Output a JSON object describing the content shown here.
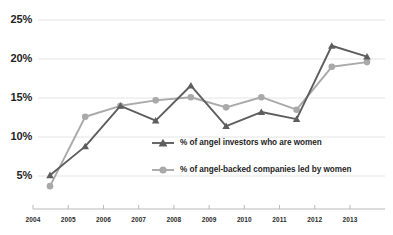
{
  "chart_data": {
    "type": "line",
    "title": "",
    "xlabel": "",
    "ylabel": "",
    "x": [
      "2004",
      "2005",
      "2006",
      "2007",
      "2008",
      "2009",
      "2010",
      "2011",
      "2012",
      "2013"
    ],
    "categories": [
      "2004",
      "2005",
      "2006",
      "2007",
      "2008",
      "2009",
      "2010",
      "2011",
      "2012",
      "2013"
    ],
    "ylim": [
      0,
      25
    ],
    "yticks": [
      5,
      10,
      15,
      20,
      25
    ],
    "ytick_labels": [
      "5%",
      "10%",
      "15%",
      "20%",
      "25%"
    ],
    "grid": true,
    "grid_axis": "y",
    "legend_position": "inside-center-right",
    "series": [
      {
        "name": "% of angel investors who are women",
        "color": "#5e5e5e",
        "marker": "triangle",
        "values": [
          5.1,
          8.8,
          14.0,
          12.1,
          16.6,
          11.4,
          13.2,
          12.3,
          21.7,
          20.3
        ]
      },
      {
        "name": "% of angel-backed companies led by women",
        "color": "#a9a9a9",
        "marker": "circle",
        "values": [
          3.7,
          12.6,
          14.0,
          14.7,
          15.1,
          13.8,
          15.1,
          13.5,
          19.0,
          19.6
        ]
      }
    ]
  },
  "axes": {
    "y_labels": [
      "25%",
      "20%",
      "15%",
      "10%",
      "5%"
    ],
    "x_labels": [
      "2004",
      "2005",
      "2006",
      "2007",
      "2008",
      "2009",
      "2010",
      "2011",
      "2012",
      "2013"
    ]
  },
  "legend": {
    "entries": [
      {
        "label": "% of angel investors who are women",
        "marker": "triangle-marker-icon",
        "color": "#5e5e5e"
      },
      {
        "label": "% of angel-backed companies led by women",
        "marker": "circle-marker-icon",
        "color": "#a9a9a9"
      }
    ]
  },
  "colors": {
    "series_dark": "#5e5e5e",
    "series_light": "#a9a9a9",
    "grid": "#e4e4e4",
    "axis": "#b8b8b8",
    "background": "#ffffff",
    "text": "#1f1f1f"
  }
}
